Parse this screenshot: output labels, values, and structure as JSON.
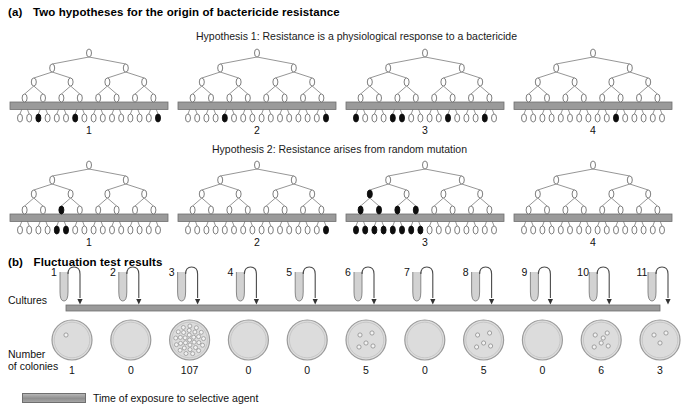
{
  "figure": {
    "panel_a": {
      "label": "(a)",
      "title": "Two hypotheses for the origin of bactericide resistance",
      "hypothesis1": {
        "title": "Hypothesis 1: Resistance is a physiological response to a bactericide",
        "trees": [
          {
            "number": "1",
            "black_leaves": [
              3,
              7,
              16
            ],
            "black_internal": []
          },
          {
            "number": "2",
            "black_leaves": [
              5,
              16
            ],
            "black_internal": []
          },
          {
            "number": "3",
            "black_leaves": [
              1,
              5,
              6,
              11,
              15
            ],
            "black_internal": []
          },
          {
            "number": "4",
            "black_leaves": [
              11
            ],
            "black_internal": []
          }
        ]
      },
      "hypothesis2": {
        "title": "Hypothesis 2: Resistance arises from random mutation",
        "trees": [
          {
            "number": "1",
            "black_leaves": [
              5,
              6
            ],
            "black_internal": [
              {
                "level": 4,
                "index": 3
              }
            ]
          },
          {
            "number": "2",
            "black_leaves": [
              16
            ],
            "black_internal": []
          },
          {
            "number": "3",
            "black_leaves": [
              1,
              2,
              3,
              4,
              5,
              6,
              7,
              8
            ],
            "black_internal": [
              {
                "level": 2,
                "index": 1
              },
              {
                "level": 3,
                "index": 1
              },
              {
                "level": 3,
                "index": 2
              },
              {
                "level": 4,
                "index": 1
              },
              {
                "level": 4,
                "index": 2
              },
              {
                "level": 4,
                "index": 3
              },
              {
                "level": 4,
                "index": 4
              }
            ]
          },
          {
            "number": "4",
            "black_leaves": [],
            "black_internal": []
          }
        ]
      }
    },
    "panel_b": {
      "label": "(b)",
      "title": "Fluctuation test results",
      "cultures_label": "Cultures",
      "colonies_label_line1": "Number",
      "colonies_label_line2": "of colonies",
      "cultures": [
        {
          "number": "1",
          "colonies": "1",
          "dots": 1
        },
        {
          "number": "2",
          "colonies": "0",
          "dots": 0
        },
        {
          "number": "3",
          "colonies": "107",
          "dots": 30
        },
        {
          "number": "4",
          "colonies": "0",
          "dots": 0
        },
        {
          "number": "5",
          "colonies": "0",
          "dots": 0
        },
        {
          "number": "6",
          "colonies": "5",
          "dots": 5
        },
        {
          "number": "7",
          "colonies": "0",
          "dots": 0
        },
        {
          "number": "8",
          "colonies": "5",
          "dots": 5
        },
        {
          "number": "9",
          "colonies": "0",
          "dots": 0
        },
        {
          "number": "10",
          "colonies": "6",
          "dots": 6
        },
        {
          "number": "11",
          "colonies": "3",
          "dots": 3
        }
      ]
    },
    "legend": {
      "text": "Time of exposure to selective agent"
    },
    "colors": {
      "bar_gray": "#9a9a9a",
      "bar_edge": "#6f6f6f",
      "cell_outline": "#707070",
      "cell_black": "#0d0d0d",
      "dish_fill": "#dcdcdc",
      "dish_edge": "#9b9b9b",
      "tube_fill": "#d2d2d2",
      "line": "#8a8a8a"
    }
  }
}
